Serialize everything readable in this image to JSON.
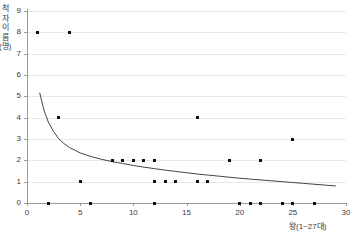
{
  "chart_data": {
    "type": "scatter",
    "title": "",
    "xlabel": "왕(1~27대)",
    "ylabel": "척자 이름(명)",
    "xlim": [
      0,
      30
    ],
    "ylim": [
      0,
      9
    ],
    "xticks": [
      0,
      5,
      10,
      15,
      20,
      25,
      30
    ],
    "yticks": [
      0,
      1,
      2,
      3,
      4,
      5,
      6,
      7,
      8,
      9
    ],
    "grid": true,
    "legend": "none",
    "series": [
      {
        "name": "관측값",
        "marker": "square",
        "color": "#111111",
        "points": [
          {
            "x": 1,
            "y": 8
          },
          {
            "x": 4,
            "y": 8
          },
          {
            "x": 3,
            "y": 4
          },
          {
            "x": 5,
            "y": 1
          },
          {
            "x": 8,
            "y": 2
          },
          {
            "x": 9,
            "y": 2
          },
          {
            "x": 10,
            "y": 2
          },
          {
            "x": 11,
            "y": 2
          },
          {
            "x": 12,
            "y": 2
          },
          {
            "x": 12,
            "y": 1
          },
          {
            "x": 13,
            "y": 1
          },
          {
            "x": 14,
            "y": 1
          },
          {
            "x": 16,
            "y": 4
          },
          {
            "x": 16,
            "y": 1
          },
          {
            "x": 17,
            "y": 1
          },
          {
            "x": 19,
            "y": 2
          },
          {
            "x": 22,
            "y": 2
          },
          {
            "x": 25,
            "y": 3
          },
          {
            "x": 2,
            "y": 0
          },
          {
            "x": 6,
            "y": 0
          },
          {
            "x": 12,
            "y": 0
          },
          {
            "x": 20,
            "y": 0
          },
          {
            "x": 21,
            "y": 0
          },
          {
            "x": 22,
            "y": 0
          },
          {
            "x": 24,
            "y": 0
          },
          {
            "x": 25,
            "y": 0
          },
          {
            "x": 27,
            "y": 0
          }
        ]
      }
    ],
    "trendline": {
      "name": "추세선",
      "type": "power",
      "color": "#444444",
      "points": [
        {
          "x": 1.2,
          "y": 5.15
        },
        {
          "x": 1.6,
          "y": 4.35
        },
        {
          "x": 2.0,
          "y": 3.8
        },
        {
          "x": 2.5,
          "y": 3.35
        },
        {
          "x": 3.0,
          "y": 3.0
        },
        {
          "x": 3.5,
          "y": 2.78
        },
        {
          "x": 4.0,
          "y": 2.6
        },
        {
          "x": 5.0,
          "y": 2.35
        },
        {
          "x": 6.0,
          "y": 2.18
        },
        {
          "x": 7.0,
          "y": 2.05
        },
        {
          "x": 8.0,
          "y": 1.94
        },
        {
          "x": 9.0,
          "y": 1.85
        },
        {
          "x": 10.0,
          "y": 1.76
        },
        {
          "x": 11.0,
          "y": 1.68
        },
        {
          "x": 12.0,
          "y": 1.61
        },
        {
          "x": 13.0,
          "y": 1.54
        },
        {
          "x": 14.0,
          "y": 1.48
        },
        {
          "x": 15.0,
          "y": 1.42
        },
        {
          "x": 16.0,
          "y": 1.36
        },
        {
          "x": 17.0,
          "y": 1.31
        },
        {
          "x": 18.0,
          "y": 1.26
        },
        {
          "x": 19.0,
          "y": 1.21
        },
        {
          "x": 20.0,
          "y": 1.16
        },
        {
          "x": 21.0,
          "y": 1.12
        },
        {
          "x": 22.0,
          "y": 1.08
        },
        {
          "x": 23.0,
          "y": 1.04
        },
        {
          "x": 24.0,
          "y": 1.0
        },
        {
          "x": 25.0,
          "y": 0.96
        },
        {
          "x": 26.0,
          "y": 0.92
        },
        {
          "x": 27.0,
          "y": 0.88
        },
        {
          "x": 28.0,
          "y": 0.84
        },
        {
          "x": 29.0,
          "y": 0.8
        }
      ]
    }
  },
  "axes": {
    "y_title": "척자 이름(명)",
    "x_title": "왕(1~27대)",
    "y_tick_labels": [
      "9",
      "8",
      "7",
      "6",
      "5",
      "4",
      "3",
      "2",
      "1",
      "0"
    ],
    "x_tick_labels": [
      "0",
      "5",
      "10",
      "15",
      "20",
      "25",
      "30"
    ]
  }
}
